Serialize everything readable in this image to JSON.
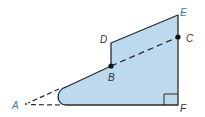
{
  "diagram": {
    "type": "geometry-figure",
    "fill_color": "#bcd9ee",
    "stroke_color": "#2b2b2b",
    "label_color_dark": "#333333",
    "label_color_blue": "#3a78b5",
    "points": [
      {
        "id": "A",
        "label": "A",
        "x": 25,
        "y": 104,
        "label_x": 12,
        "label_y": 109,
        "color": "blue"
      },
      {
        "id": "B",
        "label": "B",
        "x": 111,
        "y": 66,
        "label_x": 108,
        "label_y": 81,
        "color": "dark"
      },
      {
        "id": "C",
        "label": "C",
        "x": 178,
        "y": 37,
        "label_x": 186,
        "label_y": 42,
        "color": "dark"
      },
      {
        "id": "D",
        "label": "D",
        "x": 111,
        "y": 43,
        "label_x": 100,
        "label_y": 43,
        "color": "dark"
      },
      {
        "id": "E",
        "label": "E",
        "x": 178,
        "y": 15,
        "label_x": 180,
        "label_y": 16,
        "color": "blue"
      },
      {
        "id": "F",
        "label": "F",
        "x": 178,
        "y": 105,
        "label_x": 180,
        "label_y": 112,
        "color": "dark"
      }
    ],
    "segments": [
      {
        "from": "D",
        "to": "E",
        "style": "solid"
      },
      {
        "from": "D",
        "to": "B",
        "style": "solid"
      },
      {
        "from": "E",
        "to": "F",
        "style": "solid"
      },
      {
        "from": "B",
        "to": "C",
        "style": "dashed"
      },
      {
        "from": "A",
        "to": "B",
        "style": "dashed-extension"
      },
      {
        "from": "A",
        "to": "F",
        "style": "dashed-extension"
      }
    ],
    "right_angle_at": "F",
    "marked_points": [
      "B",
      "C"
    ]
  }
}
